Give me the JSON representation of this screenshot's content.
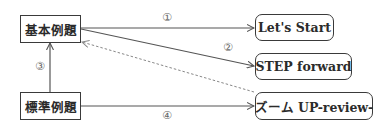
{
  "nodes": {
    "kihon": {
      "label": "基本例題"
    },
    "hyojun": {
      "label": "標準例題"
    },
    "lets_start": {
      "label": "Let's Start"
    },
    "step_forward": {
      "label": "STEP forward"
    },
    "zoom_up": {
      "label": "ズーム UP-review-"
    }
  },
  "edges": [
    {
      "id": "1",
      "label": "①",
      "from": "基本例題",
      "to": "Let's Start",
      "style": "solid"
    },
    {
      "id": "2",
      "label": "②",
      "from": "基本例題",
      "to": "STEP forward",
      "style": "solid"
    },
    {
      "id": "3",
      "label": "③",
      "from": "標準例題",
      "to": "基本例題",
      "style": "solid"
    },
    {
      "id": "4",
      "label": "④",
      "from": "標準例題",
      "to": "ズーム UP-review-",
      "style": "solid"
    },
    {
      "id": "dashed",
      "label": "",
      "from": "ズーム UP-review-",
      "to": "基本例題",
      "style": "dashed"
    }
  ],
  "colors": {
    "line": "#555555",
    "dashed": "#888888",
    "border": "#3a3a3a",
    "text": "#2b2b2b"
  }
}
